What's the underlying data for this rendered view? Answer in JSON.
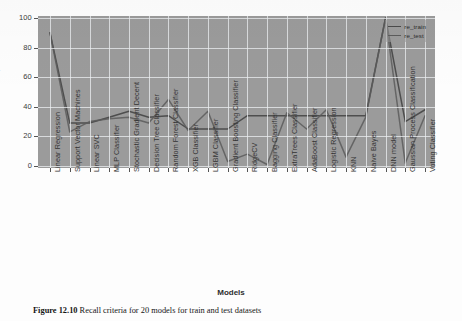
{
  "figure": {
    "caption_label": "Figure 12.10",
    "caption_text": "Recall criteria for 20 models for train and test datasets"
  },
  "legend": {
    "position": "top-right",
    "entries": [
      {
        "label": "re_train",
        "color": "#4a4a4a"
      },
      {
        "label": "re_test",
        "color": "#5c5c5c"
      }
    ]
  },
  "axes": {
    "ylabel": "re, %",
    "xlabel": "Models",
    "yticks": [
      "0",
      "20",
      "40",
      "60",
      "80",
      "100"
    ]
  },
  "chart_data": {
    "type": "line",
    "title": "Recall criteria for 20 models for train and test datasets",
    "xlabel": "Models",
    "ylabel": "re, %",
    "ylim": [
      0,
      100
    ],
    "grid": true,
    "legend_position": "upper right",
    "categories": [
      "Linear Regression",
      "Support Vector Machines",
      "Linear SVC",
      "MLP Classifier",
      "Stochastic Gradient Decent",
      "Decision Tree Classifier",
      "Random Forest Classifier",
      "XGB Classifier",
      "LGBM Classifier",
      "Gradient Boosting Classifier",
      "RidgeCV",
      "Bagging Classifier",
      "ExtraTrees Classifier",
      "AdaBoost Classifier",
      "Logistic Regression",
      "KNN",
      "Naive Bayes",
      "DNN model",
      "Gaussian Process Classification",
      "Voting Classifier"
    ],
    "series": [
      {
        "name": "re_train",
        "color": "#4a4a4a",
        "values": [
          90,
          29,
          29,
          33,
          37,
          33,
          34,
          25,
          25,
          25,
          34,
          34,
          34,
          34,
          34,
          34,
          34,
          100,
          30,
          38
        ]
      },
      {
        "name": "re_test",
        "color": "#5c5c5c",
        "values": [
          90,
          23,
          30,
          32,
          33,
          29,
          45,
          24,
          37,
          3,
          8,
          1,
          36,
          25,
          38,
          6,
          33,
          100,
          2,
          34
        ]
      }
    ]
  }
}
